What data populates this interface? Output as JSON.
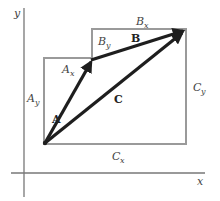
{
  "diagram": {
    "axes": {
      "x_label": "x",
      "y_label": "y"
    },
    "vectors": [
      {
        "name": "A",
        "label": "A",
        "from": "origin-point",
        "to": "A-tip"
      },
      {
        "name": "B",
        "label": "B",
        "from": "A-tip",
        "to": "B-tip"
      },
      {
        "name": "C",
        "label": "C",
        "from": "origin-point",
        "to": "B-tip"
      }
    ],
    "component_labels": {
      "Ax": {
        "base": "A",
        "sub": "x"
      },
      "Ay": {
        "base": "A",
        "sub": "y"
      },
      "Bx": {
        "base": "B",
        "sub": "x"
      },
      "By": {
        "base": "B",
        "sub": "y"
      },
      "Cx": {
        "base": "C",
        "sub": "x"
      },
      "Cy": {
        "base": "C",
        "sub": "y"
      }
    },
    "colors": {
      "vector": "#1e1e1e",
      "box": "#9a9a9a",
      "axis": "#777777",
      "label": "#444444"
    }
  }
}
